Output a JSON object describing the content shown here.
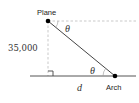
{
  "diagram": {
    "type": "right-triangle-angle-of-depression",
    "labels": {
      "plane": "Plane",
      "arch": "Arch",
      "altitude": "35,000",
      "horizontal_distance": "d",
      "angle_top": "θ",
      "angle_bottom": "θ"
    },
    "colors": {
      "line": "#444444",
      "dashed": "#bbbbbb",
      "point": "#000000",
      "background": "#ffffff"
    }
  }
}
